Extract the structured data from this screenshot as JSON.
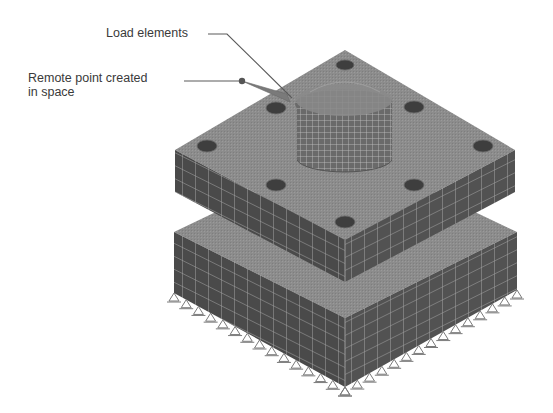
{
  "figure": {
    "type": "finite-element-mesh-diagram",
    "annotations": [
      {
        "id": "load-elements",
        "text": "Load elements"
      },
      {
        "id": "remote-point",
        "line1": "Remote point created",
        "line2": "in space"
      }
    ],
    "colors": {
      "top_face": "#8e8e8e",
      "side_face_left": "#4a4a4a",
      "side_face_right": "#555555",
      "mesh_line": "#b8b8b8",
      "hole": "#3c3c3c",
      "leader": "#5a5a5a",
      "support": "#7a7a7a",
      "text": "#3a3a3a"
    },
    "parts": {
      "top_plate": {
        "holes": 8,
        "boss": "cylindrical"
      },
      "base_block": {
        "supports": "fixed triangles along bottom edges"
      }
    }
  }
}
